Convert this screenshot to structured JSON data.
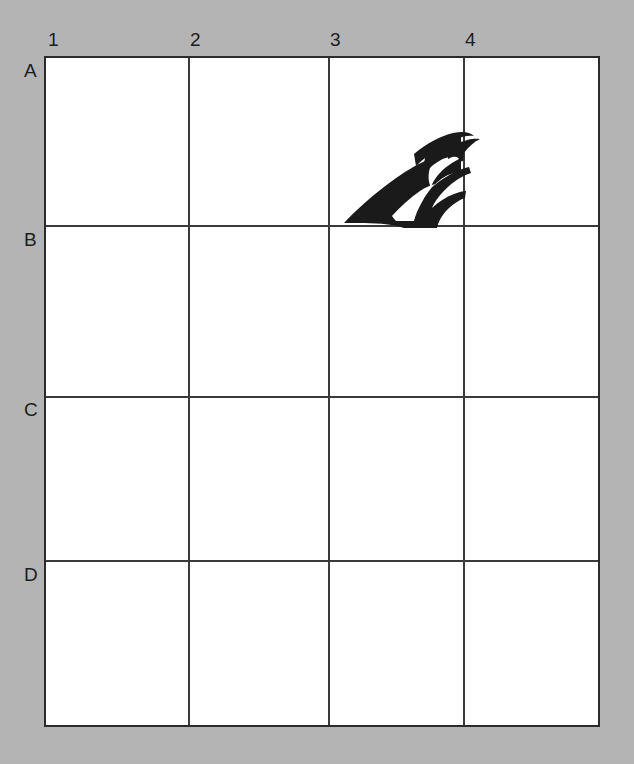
{
  "canvas": {
    "width": 634,
    "height": 764,
    "background_color": "#b4b4b4"
  },
  "grid": {
    "line_color": "#3a3a3a",
    "cell_fill_color": "#ffffff",
    "columns": 4,
    "rows": 4,
    "column_labels": [
      "1",
      "2",
      "3",
      "4"
    ],
    "row_labels": [
      "A",
      "B",
      "C",
      "D"
    ],
    "column_line_x": [
      44,
      188,
      328,
      463,
      600
    ],
    "row_line_y": [
      56,
      225,
      396,
      560,
      727
    ]
  },
  "subject": {
    "name": "canada-goose-head",
    "description": "Black silhouette of a goose head and neck",
    "silhouette_color": "#1a1a1a",
    "cheek_patch_color": "#ffffff",
    "occupied_cells": [
      "A3",
      "A4"
    ]
  }
}
